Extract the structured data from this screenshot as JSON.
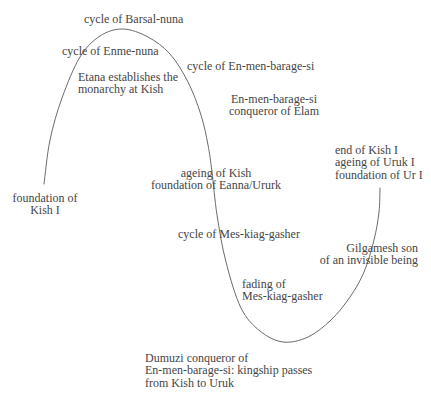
{
  "diagram": {
    "background_color": "#ffffff",
    "curve_color": "#6b6b6b",
    "text_color": "#454545",
    "curve": {
      "name": "cycle-wave",
      "points": [
        [
          44,
          184
        ],
        [
          50,
          140
        ],
        [
          62,
          98
        ],
        [
          80,
          57
        ],
        [
          100,
          36
        ],
        [
          123,
          29
        ],
        [
          148,
          37
        ],
        [
          170,
          54
        ],
        [
          188,
          82
        ],
        [
          201,
          115
        ],
        [
          208,
          145
        ],
        [
          212,
          172
        ],
        [
          217,
          215
        ],
        [
          226,
          262
        ],
        [
          241,
          308
        ],
        [
          260,
          331
        ],
        [
          283,
          342
        ],
        [
          308,
          337
        ],
        [
          331,
          320
        ],
        [
          350,
          297
        ],
        [
          364,
          272
        ],
        [
          374,
          240
        ],
        [
          379,
          212
        ],
        [
          380,
          188
        ]
      ]
    },
    "labels": [
      {
        "id": "cycle-of-barsal-nuna",
        "x": 84,
        "y": 13,
        "align": "left",
        "lines": [
          "cycle of Barsal-nuna"
        ]
      },
      {
        "id": "cycle-of-enme-nuna",
        "x": 62,
        "y": 45,
        "align": "left",
        "lines": [
          "cycle of Enme-nuna"
        ]
      },
      {
        "id": "etana-monarchy",
        "x": 78,
        "y": 71,
        "align": "left",
        "lines": [
          "Etana establishes the",
          "monarchy at Kish"
        ]
      },
      {
        "id": "cycle-of-en-men-barage-si",
        "x": 187,
        "y": 60,
        "align": "left",
        "lines": [
          "cycle of En-men-barage-si"
        ]
      },
      {
        "id": "en-men-barage-si-elam",
        "x": 274,
        "y": 93,
        "align": "center",
        "lines": [
          "En-men-barage-si",
          "conqueror of Elam"
        ]
      },
      {
        "id": "end-of-kish-i",
        "x": 335,
        "y": 144,
        "align": "left",
        "lines": [
          "end of Kish I",
          "ageing of Uruk I",
          "foundation of Ur I"
        ]
      },
      {
        "id": "ageing-of-kish",
        "x": 216,
        "y": 167,
        "align": "center",
        "lines": [
          "ageing of Kish",
          "foundation of Eanna/Ururk"
        ]
      },
      {
        "id": "foundation-of-kish-i",
        "x": 45,
        "y": 192,
        "align": "center",
        "lines": [
          "foundation of",
          "Kish I"
        ]
      },
      {
        "id": "cycle-of-mes-kiag-gasher",
        "x": 178,
        "y": 228,
        "align": "left",
        "lines": [
          "cycle of Mes-kiag-gasher"
        ]
      },
      {
        "id": "gilgamesh-invisible",
        "x": 418,
        "y": 242,
        "align": "right",
        "lines": [
          "Gilgamesh son",
          "of an invisible being"
        ]
      },
      {
        "id": "fading-of-mes-kiag-gasher",
        "x": 242,
        "y": 278,
        "align": "left",
        "lines": [
          "fading of",
          "Mes-kiag-gasher"
        ]
      },
      {
        "id": "dumuzi-kingship",
        "x": 145,
        "y": 352,
        "align": "left",
        "lines": [
          "Dumuzi conqueror of",
          "En-men-barage-si: kingship passes",
          "from Kish to Uruk"
        ]
      }
    ]
  }
}
